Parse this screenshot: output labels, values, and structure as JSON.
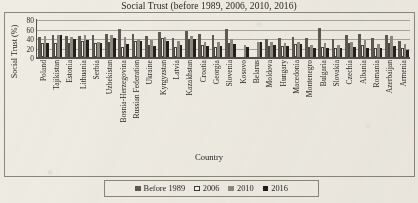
{
  "chart_data": {
    "type": "bar",
    "title": "Social Trust (before 1989, 2006, 2010, 2016)",
    "xlabel": "Country",
    "ylabel": "Social Trust (%)",
    "ylim": [
      0,
      80
    ],
    "yticks": [
      80,
      60,
      40,
      20,
      0
    ],
    "grid": true,
    "legend_position": "bottom",
    "categories": [
      "Poland",
      "Tajikistan",
      "Estonia",
      "Lithuania",
      "Serbia",
      "Uzbekistan",
      "Bosnia-Herzegovina",
      "Russian Federation",
      "Ukraine",
      "Kyrgyzstan",
      "Latvia",
      "Kazakhstan",
      "Croatia",
      "Georgia",
      "Slovenia",
      "Kosovo",
      "Belarus",
      "Moldova",
      "Hungary",
      "Macedonia",
      "Montenegro",
      "Bulgaria",
      "Slovakia",
      "Czechia",
      "Albania",
      "Romania",
      "Azerbaijan",
      "Armenia"
    ],
    "series": [
      {
        "name": "Before 1989",
        "color": "#5e5a53",
        "values": [
          43,
          46,
          45,
          44,
          46,
          49,
          60,
          49,
          44,
          52,
          41,
          55,
          48,
          46,
          60,
          0,
          0,
          38,
          40,
          42,
          40,
          62,
          38,
          46,
          48,
          41,
          47,
          34
        ]
      },
      {
        "name": "2006",
        "color": "#f6f4ee",
        "values": [
          29,
          30,
          30,
          33,
          30,
          32,
          21,
          33,
          26,
          40,
          22,
          38,
          26,
          21,
          30,
          0,
          0,
          23,
          23,
          27,
          21,
          22,
          20,
          29,
          26,
          20,
          30,
          19
        ]
      },
      {
        "name": "2010",
        "color": "#8d8880",
        "values": [
          44,
          46,
          42,
          46,
          32,
          47,
          43,
          37,
          35,
          42,
          34,
          44,
          32,
          31,
          37,
          26,
          32,
          31,
          30,
          31,
          25,
          29,
          26,
          32,
          36,
          28,
          44,
          28
        ]
      },
      {
        "name": "2016",
        "color": "#201d1a",
        "values": [
          30,
          46,
          38,
          36,
          30,
          39,
          27,
          33,
          24,
          34,
          26,
          38,
          24,
          23,
          27,
          22,
          31,
          25,
          24,
          27,
          18,
          20,
          18,
          22,
          20,
          18,
          23,
          14
        ]
      }
    ]
  }
}
